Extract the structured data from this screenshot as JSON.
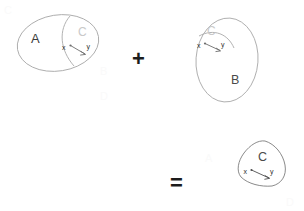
{
  "figure": {
    "kind": "set-relation-composition-diagram",
    "background_color": "#ffffff"
  },
  "operators": {
    "plus": "+",
    "equals": "="
  },
  "terms": [
    {
      "id": "term-a",
      "container_label": "A",
      "subset_label": "C",
      "shape": "ellipse",
      "relation": {
        "from_label": "x",
        "to_label": "y",
        "direction": "x-to-y"
      }
    },
    {
      "id": "term-b",
      "container_label": "B",
      "subset_label": "C",
      "shape": "ellipse",
      "relation": {
        "from_label": "x",
        "to_label": "y",
        "direction": "x-to-y"
      }
    }
  ],
  "result": {
    "id": "term-result",
    "container_label": "",
    "subset_label": "C",
    "shape": "lens-intersection",
    "relation": {
      "from_label": "x",
      "to_label": "y",
      "direction": "x-to-y"
    }
  },
  "watermarks": {
    "mark_a": "A",
    "mark_b": "B",
    "mark_c": "C",
    "mark_d": "D"
  },
  "colors": {
    "outline": "#a9a9a9",
    "outline_dark": "#7d7d7d",
    "label_set": "#3b3b3b",
    "label_subset_faint": "#c9c9c9",
    "label_subset_dark": "#4a4a4a",
    "arrow": "#6e6e6e",
    "operator": "#1c1c1c"
  }
}
